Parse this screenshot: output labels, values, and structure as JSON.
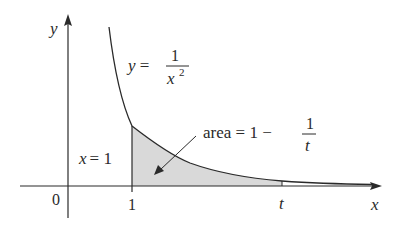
{
  "figure": {
    "axes": {
      "x_label": "x",
      "y_label": "y",
      "origin_label": "0",
      "tick_one_label": "1",
      "tick_t_label": "t"
    },
    "curve": {
      "equation_lhs": "y =",
      "equation_num": "1",
      "equation_den_base": "x",
      "equation_den_exp": "2"
    },
    "vertical_line_label": {
      "var": "x",
      "eq": "= 1"
    },
    "area_label": {
      "prefix": "area = 1 −",
      "num": "1",
      "den": "t"
    },
    "colors": {
      "stroke": "#2a2a2a",
      "shade": "#d9d9d9",
      "background": "#ffffff"
    }
  }
}
